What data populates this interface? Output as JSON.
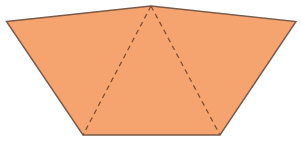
{
  "diagram": {
    "type": "net / folded shape",
    "width": 301,
    "height": 143,
    "colors": {
      "background": "#ffffff",
      "fill": "#F5A470",
      "outline": "#7A5A48",
      "fold_line": "#7A4A30"
    },
    "vertices": {
      "top_left": [
        6.5,
        21.5
      ],
      "apex": [
        151,
        6
      ],
      "top_right": [
        296,
        21.5
      ],
      "bottom_right": [
        220,
        135
      ],
      "bottom_left": [
        83,
        135
      ]
    },
    "faces": [
      {
        "name": "left-triangle",
        "points": [
          "top_left",
          "apex",
          "bottom_left"
        ]
      },
      {
        "name": "center-triangle",
        "points": [
          "apex",
          "bottom_right",
          "bottom_left"
        ]
      },
      {
        "name": "right-triangle",
        "points": [
          "apex",
          "top_right",
          "bottom_right"
        ]
      }
    ],
    "fold_lines": [
      {
        "name": "left-fold",
        "from": "apex",
        "to": "bottom_left",
        "style": "dashed"
      },
      {
        "name": "right-fold",
        "from": "apex",
        "to": "bottom_right",
        "style": "dashed"
      }
    ],
    "labels": []
  }
}
